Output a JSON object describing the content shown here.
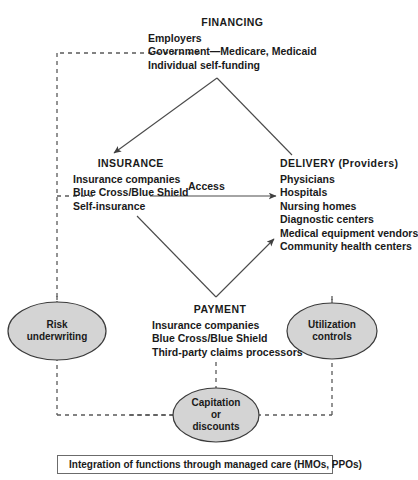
{
  "diagram": {
    "title_hidden": "",
    "nodes": {
      "financing": {
        "title": "FINANCING",
        "items": [
          "Employers",
          "Government—Medicare, Medicaid",
          "Individual self-funding"
        ]
      },
      "insurance": {
        "title": "INSURANCE",
        "items": [
          "Insurance companies",
          "Blue Cross/Blue Shield",
          "Self-insurance"
        ]
      },
      "delivery": {
        "title": "DELIVERY (Providers)",
        "items": [
          "Physicians",
          "Hospitals",
          "Nursing homes",
          "Diagnostic centers",
          "Medical equipment vendors",
          "Community health centers"
        ]
      },
      "payment": {
        "title": "PAYMENT",
        "items": [
          "Insurance companies",
          "Blue Cross/Blue Shield",
          "Third-party claims processors"
        ]
      }
    },
    "ellipses": {
      "risk": {
        "lines": [
          "Risk",
          "underwriting"
        ]
      },
      "utilization": {
        "lines": [
          "Utilization",
          "controls"
        ]
      },
      "capitation": {
        "lines": [
          "Capitation",
          "or",
          "discounts"
        ]
      }
    },
    "edges": {
      "access_label": "Access"
    },
    "legend": {
      "text": "Integration of functions through managed care (HMOs, PPOs)"
    },
    "colors": {
      "stroke": "#4a4a4a",
      "dashed": "#5a5a5a",
      "ellipse_fill": "#d4d4d4",
      "ellipse_stroke": "#3a3a3a",
      "text": "#1a1a1a"
    }
  }
}
